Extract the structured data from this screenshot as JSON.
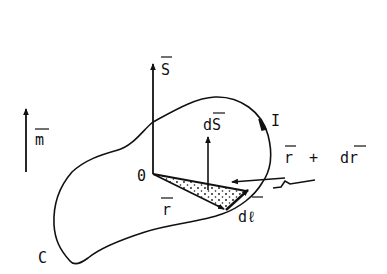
{
  "diagram": {
    "labels": {
      "S": "S",
      "m": "m",
      "dS": "dS",
      "origin": "0",
      "r": "r",
      "r_plus_dr": "r + dr",
      "r_plus_dr_r": "r",
      "r_plus_dr_plus": "+",
      "r_plus_dr_dr": "dr",
      "dl": "dℓ",
      "current": "I",
      "curve": "C"
    },
    "colors": {
      "ink": "#111111",
      "background": "#ffffff"
    },
    "elements": [
      {
        "id": "vector-S",
        "type": "arrow",
        "label": "S",
        "overbar": true
      },
      {
        "id": "vector-m",
        "type": "arrow",
        "label": "m",
        "overbar": true
      },
      {
        "id": "vector-dS",
        "type": "arrow",
        "label": "dS",
        "overbar": true
      },
      {
        "id": "vector-r",
        "type": "arrow",
        "label": "r",
        "overbar": true
      },
      {
        "id": "vector-r-plus-dr",
        "type": "arrow",
        "label": "r + dr",
        "overbar": true
      },
      {
        "id": "vector-dl",
        "type": "arrow",
        "label": "dℓ",
        "overbar": true
      },
      {
        "id": "loop-C",
        "type": "closed-curve",
        "label": "C"
      },
      {
        "id": "current-I",
        "type": "direction-arrow",
        "label": "I"
      },
      {
        "id": "shaded-triangle",
        "type": "dotted-region"
      }
    ]
  }
}
